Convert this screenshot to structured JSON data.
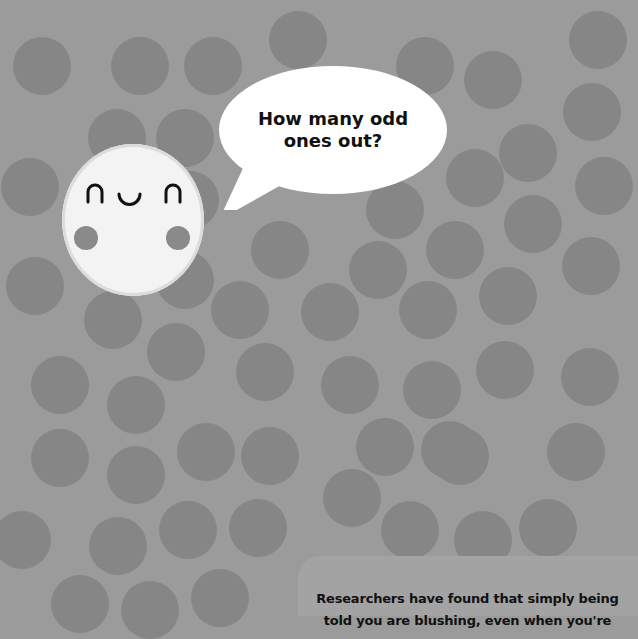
{
  "puzzle": {
    "question": "How many odd ones out?",
    "question_line1": "How many odd",
    "question_line2": "ones out?",
    "fact_line1": "Researchers have found that simply being",
    "fact_line2": "told you are blushing, even when you're"
  },
  "character": {
    "name": "smiling-face",
    "expression": "happy-closed-eyes"
  },
  "colors": {
    "background": "#9b9b9b",
    "circle": "#868686",
    "face": "#f3f3f3",
    "bubble": "#ffffff",
    "text": "#111111"
  },
  "circles": [
    [
      42,
      66
    ],
    [
      140,
      66
    ],
    [
      213,
      66
    ],
    [
      298,
      40
    ],
    [
      425,
      66
    ],
    [
      493,
      80
    ],
    [
      598,
      40
    ],
    [
      117,
      138
    ],
    [
      185,
      138
    ],
    [
      592,
      112
    ],
    [
      528,
      153
    ],
    [
      604,
      186
    ],
    [
      30,
      187
    ],
    [
      475,
      178
    ],
    [
      190,
      200
    ],
    [
      395,
      210
    ],
    [
      533,
      224
    ],
    [
      280,
      250
    ],
    [
      455,
      250
    ],
    [
      378,
      270
    ],
    [
      591,
      266
    ],
    [
      35,
      286
    ],
    [
      185,
      280
    ],
    [
      240,
      310
    ],
    [
      330,
      312
    ],
    [
      428,
      310
    ],
    [
      508,
      296
    ],
    [
      113,
      320
    ],
    [
      176,
      352
    ],
    [
      265,
      372
    ],
    [
      350,
      385
    ],
    [
      432,
      390
    ],
    [
      505,
      370
    ],
    [
      590,
      377
    ],
    [
      60,
      385
    ],
    [
      136,
      405
    ],
    [
      450,
      450
    ],
    [
      60,
      458
    ],
    [
      136,
      475
    ],
    [
      206,
      452
    ],
    [
      270,
      456
    ],
    [
      352,
      498
    ],
    [
      385,
      447
    ],
    [
      460,
      456
    ],
    [
      576,
      452
    ],
    [
      22,
      540
    ],
    [
      118,
      546
    ],
    [
      188,
      530
    ],
    [
      258,
      528
    ],
    [
      410,
      530
    ],
    [
      483,
      540
    ],
    [
      548,
      528
    ],
    [
      80,
      604
    ],
    [
      150,
      610
    ],
    [
      220,
      598
    ]
  ]
}
